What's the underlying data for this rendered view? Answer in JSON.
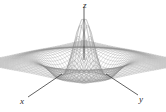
{
  "figure": {
    "title": "",
    "background_color": "#ffffff",
    "width": 166,
    "height": 112
  },
  "labels": {
    "z": "z",
    "x": "x",
    "y": "y"
  },
  "axes": {
    "z_axis": {
      "name": "z-axis-line",
      "color": "#3a3a3a"
    },
    "x_leader": {
      "name": "x-leader-line",
      "color": "#3a3a3a"
    },
    "y_leader": {
      "name": "y-leader-line",
      "color": "#3a3a3a"
    }
  },
  "chart_data": {
    "type": "line",
    "render": "3d-wireframe-surface",
    "title": "",
    "xlabel": "x",
    "ylabel": "y",
    "zlabel": "z",
    "function": "z = cos(r) * exp(-0.18 r^2) style damped radial ripple (sombrero)",
    "domain": {
      "x": [
        -8,
        8
      ],
      "y": [
        -8,
        8
      ]
    },
    "zlim": [
      -0.45,
      1.0
    ],
    "grid": false,
    "legend": null,
    "mesh": {
      "u_lines": 46,
      "v_lines": 46,
      "line_color": "#8a8a8a",
      "line_width": 0.35,
      "fill_color": "#ffffff"
    },
    "projection": {
      "type": "oblique-orthographic",
      "elevation_deg": 22,
      "azimuth_deg": 45,
      "center_px": [
        84,
        62
      ],
      "scale_x_px": 9.4,
      "scale_y_px": 4.0,
      "scale_z_px": 34
    },
    "features": [
      {
        "name": "central-peak",
        "r": 0,
        "z": 1.0
      },
      {
        "name": "first-trough-ring",
        "r": 3.14,
        "z": -0.4
      },
      {
        "name": "second-crest-ring",
        "r": 6.28,
        "z": 0.22
      }
    ],
    "annotations": [
      {
        "label": "z",
        "px": [
          84,
          6
        ]
      },
      {
        "label": "x",
        "px": [
          23,
          101
        ]
      },
      {
        "label": "y",
        "px": [
          142,
          99
        ]
      }
    ]
  }
}
